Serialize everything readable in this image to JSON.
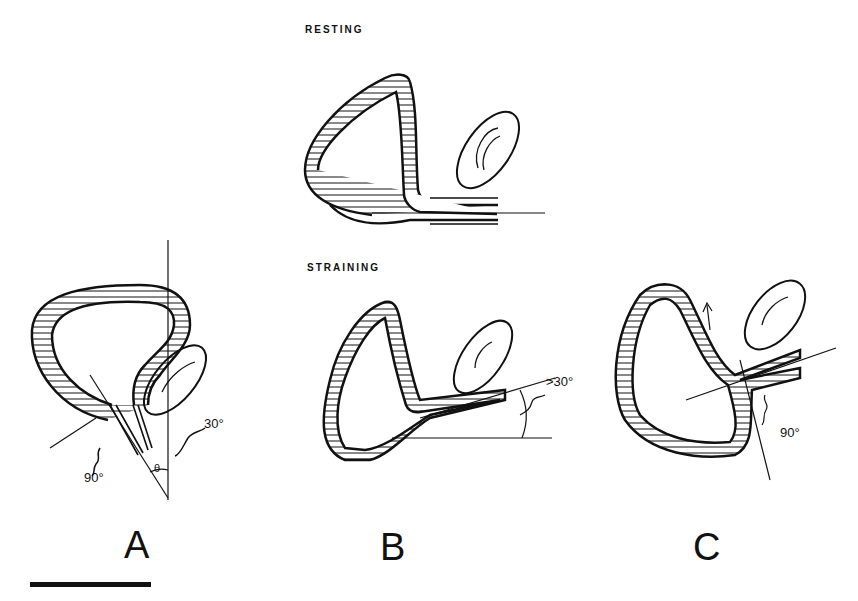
{
  "figure": {
    "captions": {
      "resting": "RESTING",
      "straining": "STRAINING"
    },
    "panels": [
      {
        "label": "A",
        "angles": [
          "30°",
          "90°"
        ],
        "symbol": "θ"
      },
      {
        "label": "B",
        "angles": [
          ">30°"
        ]
      },
      {
        "label": "C",
        "angles": [
          "90°"
        ]
      }
    ],
    "colors": {
      "ink": "#111111",
      "background": "#ffffff"
    }
  }
}
